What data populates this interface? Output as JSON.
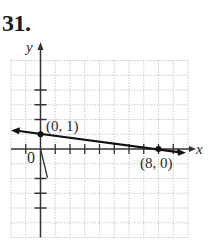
{
  "problem": {
    "number": "31."
  },
  "chart_data": {
    "type": "line",
    "title": "",
    "xlabel": "x",
    "ylabel": "y",
    "xlim": [
      -2,
      10
    ],
    "ylim": [
      -6,
      6
    ],
    "grid": true,
    "grid_style": "dotted",
    "origin_label": "0",
    "series": [
      {
        "name": "line",
        "x": [
          -2,
          0,
          8,
          10
        ],
        "y": [
          1.25,
          1,
          0,
          -0.25
        ],
        "arrows": "both",
        "equation": "y = -x/8 + 1"
      }
    ],
    "points": [
      {
        "x": 0,
        "y": 1,
        "label": "(0, 1)"
      },
      {
        "x": 8,
        "y": 0,
        "label": "(8, 0)"
      }
    ],
    "y_ticks_marked": [
      -4,
      -3,
      -2,
      2,
      3,
      4
    ],
    "x_ticks_marked": [
      -1,
      1,
      2,
      3,
      4,
      5,
      6,
      7,
      8,
      9
    ]
  },
  "labels": {
    "x_axis": "x",
    "y_axis": "y",
    "origin": "0",
    "point_a": "(0, 1)",
    "point_b": "(8, 0)"
  }
}
